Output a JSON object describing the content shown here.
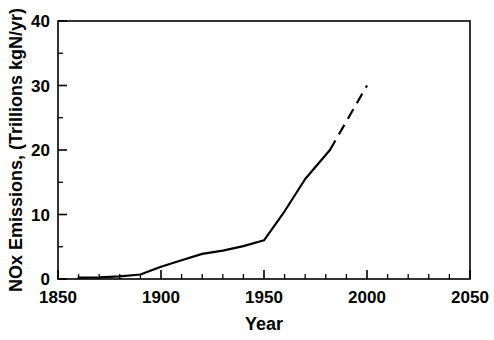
{
  "chart_data": {
    "type": "line",
    "title": "",
    "xlabel": "Year",
    "ylabel": "NOx Emissions, (Trillions kgN/yr)",
    "xlim": [
      1850,
      2050
    ],
    "ylim": [
      0,
      40
    ],
    "x_ticks": [
      1850,
      1900,
      1950,
      2000,
      2050
    ],
    "x_tick_labels": [
      "1850",
      "1900",
      "1950",
      "2000",
      "2050"
    ],
    "x_minor_tick_interval": 10,
    "y_ticks": [
      0,
      10,
      20,
      30,
      40
    ],
    "y_tick_labels": [
      "0",
      "10",
      "20",
      "30",
      "40"
    ],
    "y_minor_tick_interval": 5,
    "grid": false,
    "legend": false,
    "legend_position": "none",
    "series": [
      {
        "name": "Historical NOx emissions",
        "style": "solid",
        "color": "#000000",
        "x": [
          1860,
          1870,
          1880,
          1890,
          1900,
          1910,
          1920,
          1930,
          1940,
          1950,
          1960,
          1970,
          1982
        ],
        "values": [
          0.2,
          0.25,
          0.4,
          0.7,
          1.9,
          2.9,
          3.9,
          4.4,
          5.1,
          6.0,
          10.5,
          15.5,
          20.0
        ]
      },
      {
        "name": "Projected NOx emissions",
        "style": "dashed",
        "color": "#000000",
        "x": [
          1982,
          2000
        ],
        "values": [
          20.0,
          30.0
        ]
      }
    ],
    "annotations": []
  },
  "figure": {
    "background_color": "#ffffff",
    "axis_color": "#000000"
  }
}
